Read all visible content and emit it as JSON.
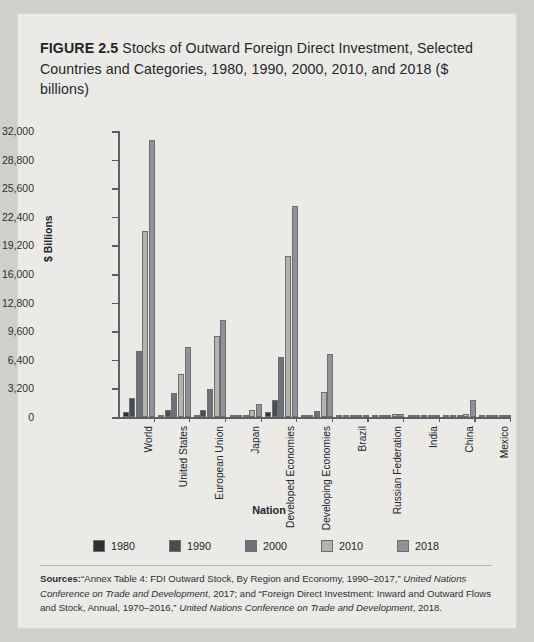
{
  "figure": {
    "label": "FIGURE 2.5",
    "title": "Stocks of Outward Foreign Direct Investment, Selected Countries and Categories, 1980, 1990, 2000, 2010, and 2018 ($ billions)"
  },
  "sources": {
    "heading": "Sources:",
    "text_1": "“Annex Table 4: FDI Outward Stock, By Region and Economy, 1990–2017,” ",
    "em_1": "United Nations Conference on Trade and Development",
    "text_2": ", 2017; and “Foreign Direct Investment: Inward and Outward Flows and Stock, Annual, 1970–2016,” ",
    "em_2": "United Nations Conference on Trade and Development",
    "text_3": ", 2018."
  },
  "chart_data": {
    "type": "bar",
    "title": "Stocks of Outward Foreign Direct Investment, Selected Countries and Categories, 1980, 1990, 2000, 2010, and 2018 ($ billions)",
    "xlabel": "Nation",
    "ylabel": "$ Billions",
    "ylim": [
      0,
      32000
    ],
    "ytick_step": 3200,
    "ytick_labels": [
      "0",
      "3,200",
      "6,400",
      "9,600",
      "12,800",
      "16,000",
      "19,200",
      "22,400",
      "25,600",
      "28,800",
      "32,000"
    ],
    "ytick_values": [
      0,
      3200,
      6400,
      9600,
      12800,
      16000,
      19200,
      22400,
      25600,
      28800,
      32000
    ],
    "grid": false,
    "legend_position": "bottom",
    "categories": [
      "World",
      "United States",
      "European Union",
      "Japan",
      "Developed Economies",
      "Developing Economies",
      "Brazil",
      "Russian Federation",
      "India",
      "China",
      "Mexico"
    ],
    "series": [
      {
        "name": "1980",
        "color": "#2f3134",
        "values": [
          559,
          220,
          213,
          20,
          535,
          24,
          38,
          0,
          0,
          0,
          0
        ]
      },
      {
        "name": "1990",
        "color": "#4a4d50",
        "values": [
          2086,
          731,
          811,
          201,
          1946,
          140,
          41,
          0,
          0,
          4,
          3
        ]
      },
      {
        "name": "2000",
        "color": "#6e7276",
        "values": [
          7377,
          2694,
          3086,
          278,
          6699,
          678,
          52,
          20,
          2,
          28,
          8
        ]
      },
      {
        "name": "2010",
        "color": "#b6b3ad",
        "values": [
          20865,
          4810,
          9064,
          831,
          18045,
          2820,
          191,
          366,
          96,
          317,
          116
        ]
      },
      {
        "name": "2018",
        "color": "#8f9296",
        "values": [
          30975,
          7799,
          10819,
          1444,
          23600,
          7000,
          270,
          344,
          166,
          1900,
          184
        ]
      }
    ]
  }
}
